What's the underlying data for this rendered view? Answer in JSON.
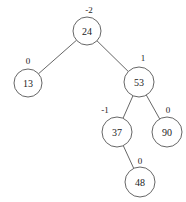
{
  "diagram": {
    "type": "avl-tree",
    "nodes": [
      {
        "id": "n24",
        "key": "24",
        "balance": "-2",
        "cx": 87,
        "cy": 31,
        "r": 14,
        "bx": 89,
        "by": 10
      },
      {
        "id": "n13",
        "key": "13",
        "balance": "0",
        "cx": 28,
        "cy": 83,
        "r": 14,
        "bx": 28,
        "by": 61
      },
      {
        "id": "n53",
        "key": "53",
        "balance": "1",
        "cx": 139,
        "cy": 82,
        "r": 15,
        "bx": 143,
        "by": 58
      },
      {
        "id": "n37",
        "key": "37",
        "balance": "-1",
        "cx": 117,
        "cy": 132,
        "r": 15,
        "bx": 105,
        "by": 110
      },
      {
        "id": "n90",
        "key": "90",
        "balance": "0",
        "cx": 167,
        "cy": 132,
        "r": 15,
        "bx": 168,
        "by": 110
      },
      {
        "id": "n48",
        "key": "48",
        "balance": "0",
        "cx": 140,
        "cy": 182,
        "r": 15,
        "bx": 140,
        "by": 161
      }
    ],
    "edges": [
      {
        "from": "n24",
        "to": "n13"
      },
      {
        "from": "n24",
        "to": "n53"
      },
      {
        "from": "n53",
        "to": "n37"
      },
      {
        "from": "n53",
        "to": "n90"
      },
      {
        "from": "n37",
        "to": "n48"
      }
    ]
  }
}
